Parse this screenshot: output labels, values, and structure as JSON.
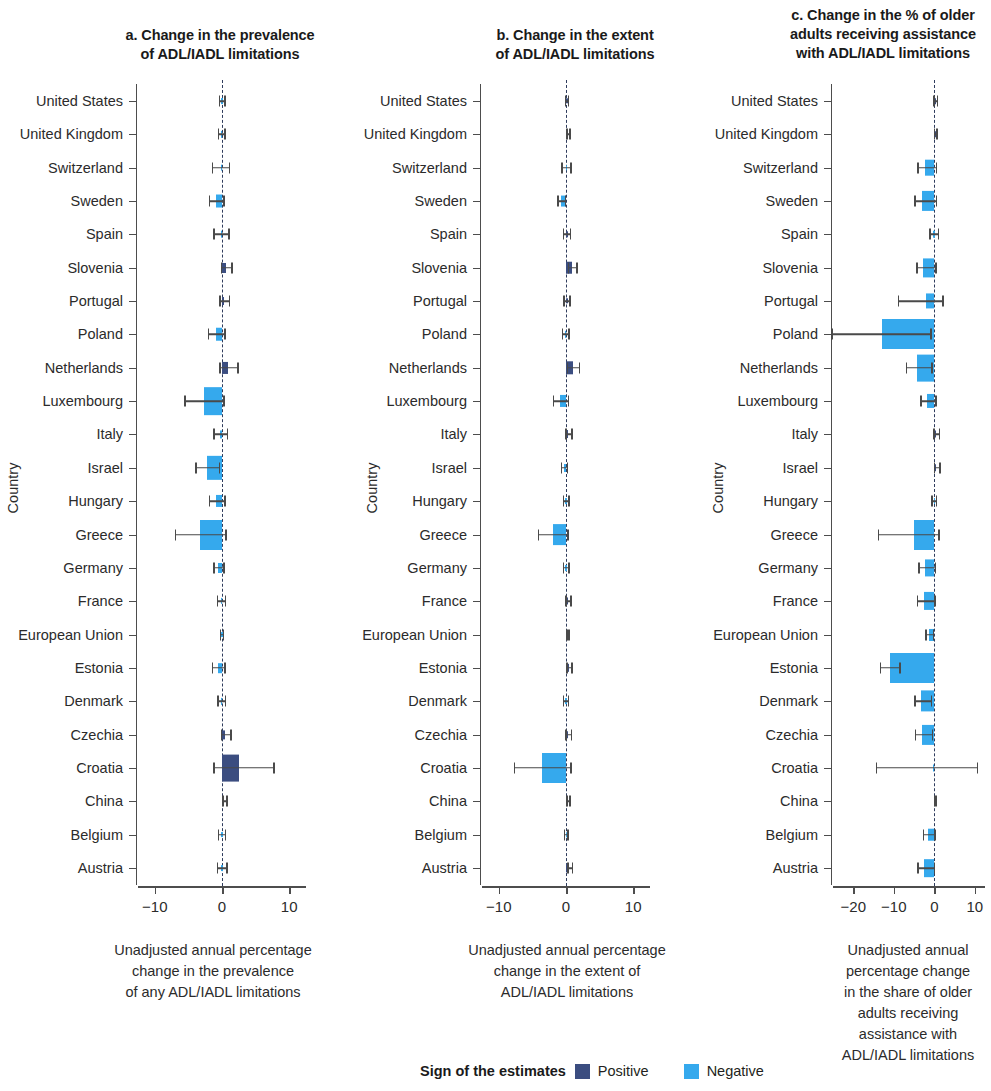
{
  "chart_data": {
    "type": "bar",
    "orientation": "horizontal",
    "grid": false,
    "legend": {
      "position": "bottom-center",
      "title": "Sign of the estimates",
      "entries": [
        {
          "label": "Positive",
          "color": "#3b4d80"
        },
        {
          "label": "Negative",
          "color": "#35a9ed"
        }
      ]
    },
    "ylabel": "Country",
    "categories": [
      "United States",
      "United Kingdom",
      "Switzerland",
      "Sweden",
      "Spain",
      "Slovenia",
      "Portugal",
      "Poland",
      "Netherlands",
      "Luxembourg",
      "Italy",
      "Israel",
      "Hungary",
      "Greece",
      "Germany",
      "France",
      "European Union",
      "Estonia",
      "Denmark",
      "Czechia",
      "Croatia",
      "China",
      "Belgium",
      "Austria"
    ],
    "panels": [
      {
        "key": "a",
        "title": "a. Change in the prevalence of ADL/IADL limitations",
        "title_lines": [
          "a. Change in the prevalence",
          "of ADL/IADL limitations"
        ],
        "xlabel_lines": [
          "Unadjusted annual percentage",
          "change  in the prevalence",
          "of any ADL/IADL  limitations"
        ],
        "xlim": [
          -12.5,
          12.5
        ],
        "xticks": [
          -10,
          0,
          10
        ],
        "xticklabels": [
          "−10",
          "0",
          "10"
        ],
        "values": [
          -0.1,
          -0.15,
          -0.2,
          -0.95,
          -0.2,
          0.6,
          0.35,
          -0.9,
          0.85,
          -2.7,
          -0.25,
          -2.3,
          -0.85,
          -3.3,
          -0.6,
          -0.15,
          -0.1,
          -0.55,
          -0.15,
          0.5,
          2.6,
          0.3,
          -0.1,
          -0.1
        ],
        "ci_low": [
          -0.5,
          -0.6,
          -1.5,
          -2.0,
          -1.3,
          -0.2,
          -0.4,
          -2.1,
          -0.4,
          -5.6,
          -1.3,
          -4.0,
          -2.0,
          -7.0,
          -1.3,
          -0.8,
          -0.35,
          -1.5,
          -0.7,
          -0.2,
          -1.3,
          0.0,
          -0.6,
          -0.8
        ],
        "ci_high": [
          0.3,
          0.3,
          1.0,
          0.2,
          0.9,
          1.4,
          1.0,
          0.3,
          2.3,
          0.2,
          0.7,
          -0.5,
          0.3,
          0.5,
          0.2,
          0.4,
          0.1,
          0.3,
          0.4,
          1.2,
          7.6,
          0.6,
          0.4,
          0.6
        ]
      },
      {
        "key": "b",
        "title": "b. Change in the extent of ADL/IADL limitations",
        "title_lines": [
          "b. Change in the extent",
          "of ADL/IADL limitations"
        ],
        "xlabel_lines": [
          "Unadjusted annual percentage",
          "change in the extent of",
          "ADL/IADL limitations"
        ],
        "xlim": [
          -12.5,
          12.5
        ],
        "xticks": [
          -10,
          0,
          10
        ],
        "xticklabels": [
          "−10",
          "0",
          "10"
        ],
        "values": [
          0.05,
          0.3,
          -0.05,
          -0.7,
          0.05,
          0.9,
          0.05,
          -0.15,
          1.0,
          -0.85,
          0.35,
          -0.35,
          -0.1,
          -2.0,
          -0.1,
          0.25,
          0.15,
          0.4,
          -0.1,
          0.3,
          -3.6,
          0.25,
          -0.05,
          0.5
        ],
        "ci_low": [
          -0.2,
          0.05,
          -0.7,
          -1.3,
          -0.5,
          0.25,
          -0.4,
          -0.6,
          0.1,
          -2.0,
          -0.1,
          -0.8,
          -0.5,
          -4.2,
          -0.5,
          -0.1,
          0.0,
          0.05,
          -0.45,
          -0.1,
          -7.8,
          0.05,
          -0.3,
          0.15
        ],
        "ci_high": [
          0.25,
          0.5,
          0.6,
          -0.15,
          0.55,
          1.5,
          0.45,
          0.3,
          1.9,
          0.25,
          0.75,
          0.1,
          0.3,
          0.2,
          0.3,
          0.6,
          0.3,
          0.75,
          0.25,
          0.7,
          0.6,
          0.45,
          0.2,
          0.85
        ]
      },
      {
        "key": "c",
        "title": "c. Change in the % of older adults receiving assistance with ADL/IADL limitations",
        "title_lines": [
          "c. Change in the % of older",
          "adults receiving assistance",
          "with ADL/IADL limitations"
        ],
        "xlabel_lines": [
          "Unadjusted annual",
          "percentage change",
          "in the share of older",
          "adults receiving",
          "assistance with",
          "ADL/IADL limitations"
        ],
        "xlim": [
          -25,
          12.5
        ],
        "xticks": [
          -20,
          -10,
          0,
          10
        ],
        "xticklabels": [
          "−20",
          "−10",
          "0",
          "10"
        ],
        "values": [
          0.1,
          0.1,
          -2.3,
          -3.0,
          -0.3,
          -2.8,
          -2.0,
          -13.0,
          -4.3,
          -1.8,
          0.4,
          0.5,
          -0.2,
          -5.0,
          -2.4,
          -2.6,
          -1.4,
          -11.0,
          -3.2,
          -3.0,
          -0.4,
          0.0,
          -1.5,
          -2.5
        ],
        "ci_low": [
          -0.3,
          -0.2,
          -4.2,
          -5.0,
          -1.2,
          -4.5,
          -9.0,
          -25.5,
          -7.0,
          -3.5,
          -0.3,
          -0.2,
          -0.7,
          -14.0,
          -4.0,
          -4.3,
          -2.2,
          -13.5,
          -5.0,
          -4.8,
          -14.5,
          -0.2,
          -2.8,
          -4.2
        ],
        "ci_high": [
          0.6,
          0.5,
          0.4,
          0.3,
          0.8,
          0.2,
          2.0,
          -1.0,
          -0.8,
          0.2,
          1.1,
          1.2,
          0.3,
          1.0,
          0.1,
          0.0,
          -0.4,
          -8.6,
          -0.9,
          -0.6,
          10.5,
          0.2,
          0.0,
          -0.2
        ]
      }
    ]
  }
}
